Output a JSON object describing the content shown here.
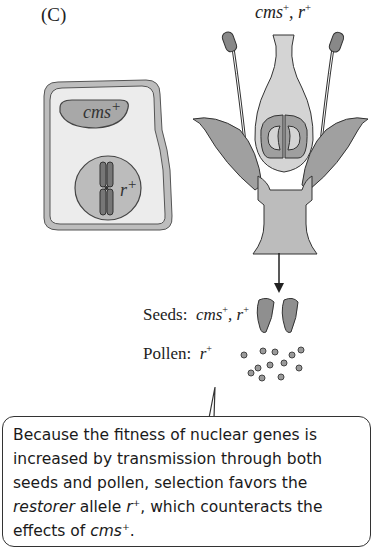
{
  "panel": {
    "label": "(C)"
  },
  "flower": {
    "genotype_label": "cms",
    "genotype_sup1": "+",
    "genotype_sep": ", r",
    "genotype_sup2": "+"
  },
  "cell": {
    "cytoplasm_label": "cms",
    "cytoplasm_sup": "+",
    "nucleus_label": "r",
    "nucleus_sup": "+"
  },
  "seeds": {
    "label": "Seeds:",
    "genotype_a": "cms",
    "sup_a": "+",
    "sep": ", r",
    "sup_b": "+"
  },
  "pollen": {
    "label": "Pollen:",
    "genotype": "r",
    "sup": "+"
  },
  "callout": {
    "line1": "Because the fitness of nuclear genes is",
    "line2": "increased by transmission through both",
    "line3": "seeds and pollen, selection favors the",
    "line4_italic": "restorer",
    "line4_mid": " allele ",
    "line4_r": "r",
    "line4_sup": "+",
    "line4_end": ", which counteracts the",
    "line5_start": "effects of ",
    "line5_italic": "cms",
    "line5_sup": "+",
    "line5_end": "."
  },
  "colors": {
    "dark_gray": "#8a8a8a",
    "medium_gray": "#a9a9a9",
    "light_gray": "#d6d6d6",
    "cell_fill": "#ebebeb",
    "outline": "#333333"
  }
}
